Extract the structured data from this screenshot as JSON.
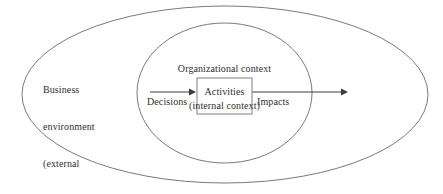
{
  "diagram": {
    "type": "nested-ellipse-process-diagram",
    "background_color": "#ffffff",
    "stroke_color": "#555555",
    "text_color": "#2f2f2f",
    "outer_ellipse": {
      "name": "business-environment-ellipse",
      "label_lines": [
        "Business",
        "environment",
        "(external",
        "context)"
      ]
    },
    "inner_ellipse": {
      "name": "organizational-context-ellipse",
      "label_lines": [
        "Organizational context",
        "(internal context)"
      ]
    },
    "process_box": {
      "name": "activities-box",
      "label": "Activities",
      "fill_color": "#ffffff",
      "border_color": "#8a8a8a"
    },
    "input_arrow": {
      "name": "decisions-arrow",
      "label": "Decisions",
      "direction": "right"
    },
    "output_arrow": {
      "name": "impacts-arrow",
      "label": "Impacts",
      "direction": "right"
    }
  }
}
